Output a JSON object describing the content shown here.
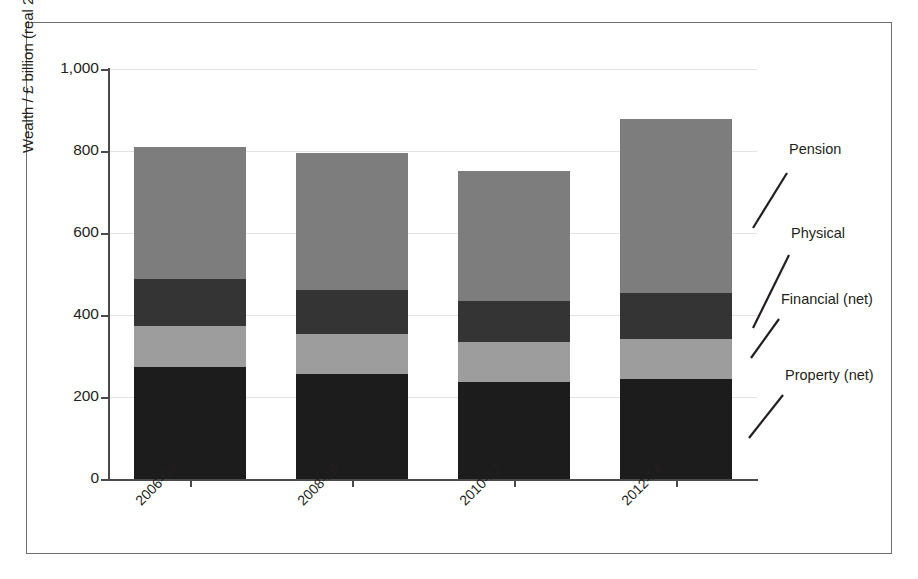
{
  "chart_data": {
    "type": "bar",
    "subtype": "stacked-vertical",
    "title": "",
    "xlabel": "",
    "ylabel": "Wealth / £ billion (real 2015 prices)",
    "categories": [
      "2006-08",
      "2008-10",
      "2010-12",
      "2012-14"
    ],
    "ylim": [
      0,
      1000
    ],
    "yticks": [
      0,
      200,
      400,
      600,
      800,
      1000
    ],
    "ytick_labels": [
      "0",
      "200",
      "400",
      "600",
      "800",
      "1,000"
    ],
    "grid": true,
    "grid_axis": "y",
    "legend_position": "right-annotations",
    "stack_order_bottom_to_top": [
      "Property (net)",
      "Financial (net)",
      "Physical",
      "Pension"
    ],
    "series": [
      {
        "name": "Property (net)",
        "color": "#1c1c1c",
        "values": [
          273,
          256,
          237,
          244
        ]
      },
      {
        "name": "Financial (net)",
        "color": "#9d9d9d",
        "values": [
          100,
          97,
          98,
          97
        ]
      },
      {
        "name": "Physical",
        "color": "#343434",
        "values": [
          115,
          108,
          98,
          113
        ]
      },
      {
        "name": "Pension",
        "color": "#7d7d7d",
        "values": [
          322,
          334,
          318,
          424
        ]
      }
    ],
    "totals": [
      810,
      795,
      751,
      878
    ],
    "annotations": [
      {
        "label": "Pension",
        "series": "Pension"
      },
      {
        "label": "Physical",
        "series": "Physical"
      },
      {
        "label": "Financial (net)",
        "series": "Financial (net)"
      },
      {
        "label": "Property (net)",
        "series": "Property (net)"
      }
    ]
  },
  "figure": {
    "border_color": "#6f6f6f",
    "background": "#ffffff",
    "axis_color": "#4a4a4a",
    "grid_color": "#e2e2e2"
  }
}
